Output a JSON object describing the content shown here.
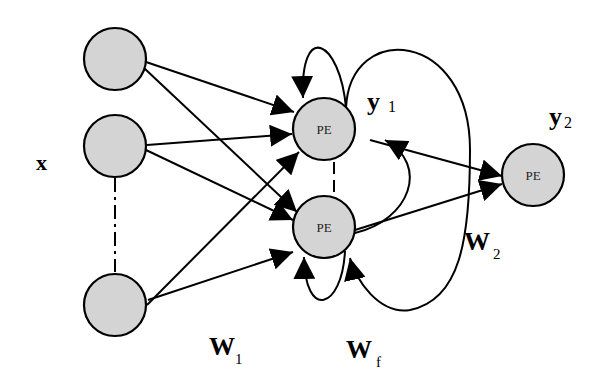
{
  "diagram": {
    "title": "",
    "labels": {
      "input": "x",
      "y1_main": "y",
      "y1_sub": "1",
      "y2_main": "y",
      "y2_sub": "2",
      "w1_main": "W",
      "w1_sub": "1",
      "wf_main": "W",
      "wf_sub": "f",
      "w2_main": "W",
      "w2_sub": "2"
    },
    "nodes": [
      {
        "id": "in1",
        "label": "",
        "role": "input"
      },
      {
        "id": "in2",
        "label": "",
        "role": "input"
      },
      {
        "id": "in3",
        "label": "",
        "role": "input"
      },
      {
        "id": "pe1",
        "label": "PE",
        "role": "hidden"
      },
      {
        "id": "pe2",
        "label": "PE",
        "role": "hidden"
      },
      {
        "id": "pe_out",
        "label": "PE",
        "role": "output"
      }
    ],
    "edges": [
      {
        "from": "in1",
        "to": "pe1"
      },
      {
        "from": "in1",
        "to": "pe2"
      },
      {
        "from": "in2",
        "to": "pe1"
      },
      {
        "from": "in2",
        "to": "pe2"
      },
      {
        "from": "in3",
        "to": "pe1"
      },
      {
        "from": "in3",
        "to": "pe2"
      },
      {
        "from": "pe1",
        "to": "pe1",
        "type": "self-loop"
      },
      {
        "from": "pe2",
        "to": "pe2",
        "type": "self-loop"
      },
      {
        "from": "pe2",
        "to": "pe1",
        "type": "feedback"
      },
      {
        "from": "pe1",
        "to": "pe2",
        "type": "feedback"
      },
      {
        "from": "pe1",
        "to": "pe_out"
      },
      {
        "from": "pe2",
        "to": "pe_out"
      }
    ],
    "colors": {
      "node_fill": "#d4d4d4",
      "stroke": "#000000",
      "background": "#ffffff"
    }
  }
}
